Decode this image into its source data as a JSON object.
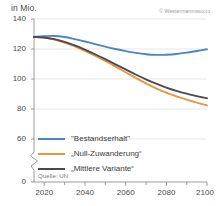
{
  "header": {
    "unit_label": "in Mio.",
    "copyright_owner": "© Westermann",
    "copyright_code": "3860013"
  },
  "source": {
    "label": "Quelle: UN"
  },
  "legend": [
    {
      "label": "\"Bestandserhalt\"",
      "color": "#4a86c5",
      "name": "bestandserhalt"
    },
    {
      "label": "„Null-Zuwanderung“",
      "color": "#e8953f",
      "name": "null-zuwanderung"
    },
    {
      "label": "„Mittlere Variante“",
      "color": "#4a4a52",
      "name": "mittlere-variante"
    }
  ],
  "axes": {
    "y_ticks": [
      "140",
      "120",
      "100",
      "80",
      "60",
      "0"
    ],
    "x_ticks": [
      "2020",
      "2040",
      "2060",
      "2080",
      "2100"
    ],
    "y_break_between": [
      "60",
      "0"
    ]
  },
  "chart_data": {
    "type": "line",
    "title": "",
    "xlabel": "",
    "ylabel": "in Mio.",
    "ylim": [
      60,
      140
    ],
    "xlim": [
      2015,
      2100
    ],
    "grid": true,
    "legend_position": "inside-bottom-left",
    "y_axis_break": true,
    "x": [
      2015,
      2020,
      2025,
      2030,
      2035,
      2040,
      2045,
      2050,
      2055,
      2060,
      2065,
      2070,
      2075,
      2080,
      2085,
      2090,
      2095,
      2100
    ],
    "series": [
      {
        "name": "\"Bestandserhalt\"",
        "color": "#4a86c5",
        "values": [
          128.0,
          128.6,
          128.7,
          128.0,
          126.6,
          125.0,
          123.3,
          121.6,
          120.0,
          118.6,
          117.4,
          116.5,
          116.1,
          116.2,
          116.7,
          117.6,
          118.7,
          119.8
        ]
      },
      {
        "name": "„Null-Zuwanderung“",
        "color": "#e8953f",
        "values": [
          128.0,
          127.6,
          126.3,
          124.3,
          121.8,
          118.8,
          115.5,
          112.0,
          108.3,
          104.5,
          100.7,
          97.1,
          93.8,
          90.9,
          88.4,
          86.2,
          84.2,
          82.4
        ]
      },
      {
        "name": "„Mittlere Variante“",
        "color": "#4a4a52",
        "values": [
          128.0,
          127.7,
          126.6,
          124.8,
          122.4,
          119.6,
          116.5,
          113.2,
          109.8,
          106.4,
          103.0,
          99.8,
          96.9,
          94.3,
          92.1,
          90.2,
          88.6,
          87.2
        ]
      }
    ]
  }
}
